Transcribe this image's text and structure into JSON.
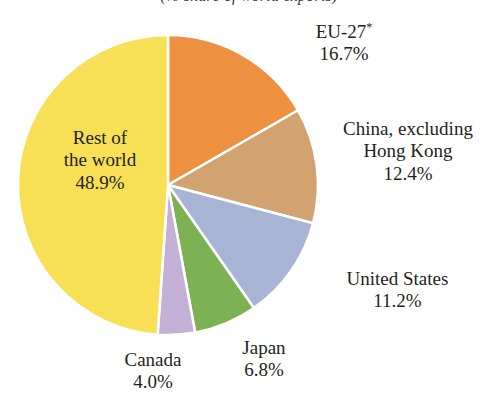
{
  "chart_data": {
    "type": "pie",
    "title": "(% share of world exports)",
    "xlabel": "",
    "ylabel": "",
    "units": "percent",
    "start_angle_deg": 0,
    "direction": "clockwise",
    "legend": "none (direct slice labels)",
    "grid": false,
    "categories": [
      "EU-27*",
      "China, excluding Hong Kong",
      "United States",
      "Japan",
      "Canada",
      "Rest of the world"
    ],
    "values": [
      16.7,
      12.4,
      11.2,
      6.8,
      4.0,
      48.9
    ],
    "colors": [
      "#ED9040",
      "#D2A370",
      "#A8B4D4",
      "#7DB254",
      "#C3B0D6",
      "#F7E055"
    ],
    "slices": [
      {
        "key": "eu",
        "name_line1": "EU-27",
        "superscript": "*",
        "value_label": "16.7%",
        "value": 16.7,
        "color": "#ED9040",
        "label_placement": "outside"
      },
      {
        "key": "china",
        "name_line1": "China, excluding",
        "name_line2": "Hong Kong",
        "value_label": "12.4%",
        "value": 12.4,
        "color": "#D2A370",
        "label_placement": "outside"
      },
      {
        "key": "us",
        "name_line1": "United States",
        "value_label": "11.2%",
        "value": 11.2,
        "color": "#A8B4D4",
        "label_placement": "outside"
      },
      {
        "key": "japan",
        "name_line1": "Japan",
        "value_label": "6.8%",
        "value": 6.8,
        "color": "#7DB254",
        "label_placement": "outside"
      },
      {
        "key": "canada",
        "name_line1": "Canada",
        "value_label": "4.0%",
        "value": 4.0,
        "color": "#C3B0D6",
        "label_placement": "outside"
      },
      {
        "key": "rest",
        "name_line1": "Rest of",
        "name_line2": "the world",
        "value_label": "48.9%",
        "value": 48.9,
        "color": "#F7E055",
        "label_placement": "inside"
      }
    ]
  },
  "geometry": {
    "center_x": 168,
    "center_y": 185,
    "radius": 150,
    "separator_color": "#ffffff",
    "separator_width": 2.5,
    "background": "#ffffff"
  }
}
